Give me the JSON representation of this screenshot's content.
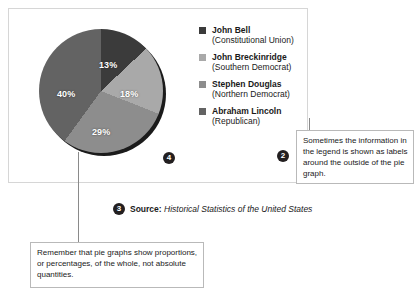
{
  "chart_data": {
    "type": "pie",
    "title": "",
    "legend_position": "right",
    "categories": [
      "John Bell (Constitutional Union)",
      "John Breckinridge (Southern Democrat)",
      "Stephen Douglas (Northern Democrat)",
      "Abraham Lincoln (Republican)"
    ],
    "values": [
      13,
      18,
      29,
      40
    ],
    "value_labels": [
      "13%",
      "18%",
      "29%",
      "40%"
    ],
    "unit": "percent",
    "start_angle_deg": 0,
    "direction": "clockwise",
    "slice_colors": [
      "#3b3b3b",
      "#a9a9a9",
      "#8d8d8d",
      "#636363"
    ]
  },
  "legend": {
    "items": [
      {
        "name": "John Bell",
        "party": "(Constitutional Union)",
        "color": "#3b3b3b"
      },
      {
        "name": "John Breckinridge",
        "party": "(Southern Democrat)",
        "color": "#a9a9a9"
      },
      {
        "name": "Stephen Douglas",
        "party": "(Northern Democrat)",
        "color": "#8d8d8d"
      },
      {
        "name": "Abraham Lincoln",
        "party": "(Republican)",
        "color": "#636363"
      }
    ]
  },
  "slice_labels": [
    {
      "text": "13%",
      "left": 62,
      "top": 33
    },
    {
      "text": "18%",
      "left": 83,
      "top": 62
    },
    {
      "text": "29%",
      "left": 55,
      "top": 100
    },
    {
      "text": "40%",
      "left": 20,
      "top": 62
    }
  ],
  "badges": {
    "pie_slice_marker": "4",
    "legend_marker": "2",
    "source_marker": "3"
  },
  "source": {
    "label": "Source:",
    "title": "Historical Statistics of the United States"
  },
  "callouts": {
    "bottom": "Remember that pie graphs show proportions, or percentages, of the whole, not absolute quantities.",
    "right": "Sometimes the information in the legend is shown as labels around the outside of the pie graph."
  }
}
